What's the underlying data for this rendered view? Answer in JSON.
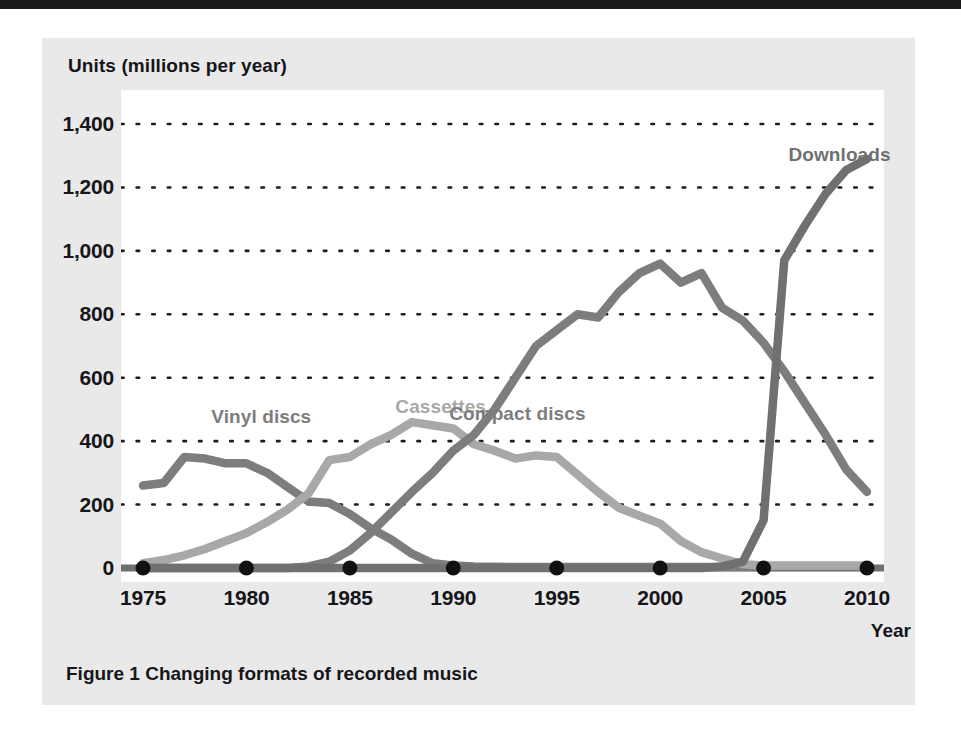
{
  "figure": {
    "caption": "Figure 1  Changing formats of recorded music",
    "panel_color": "#e9e9e9",
    "plot_bg": "#ffffff",
    "top_bar_color": "#1b1b1b"
  },
  "chart_data": {
    "type": "line",
    "title": "Figure 1  Changing formats of recorded music",
    "xlabel": "Year",
    "ylabel": "Units (millions per year)",
    "xlim": [
      1975,
      2010
    ],
    "ylim": [
      0,
      1400
    ],
    "xticks": [
      1975,
      1980,
      1985,
      1990,
      1995,
      2000,
      2005,
      2010
    ],
    "xtick_labels": [
      "1975",
      "1980",
      "1985",
      "1990",
      "1995",
      "2000",
      "2005",
      "2010"
    ],
    "yticks": [
      0,
      200,
      400,
      600,
      800,
      1000,
      1200,
      1400
    ],
    "ytick_labels": [
      "0",
      "200",
      "400",
      "600",
      "800",
      "1,000",
      "1,200",
      "1,400"
    ],
    "grid": "horizontal-dotted",
    "legend_position": "inline-labels",
    "x": [
      1975,
      1976,
      1977,
      1978,
      1979,
      1980,
      1981,
      1982,
      1983,
      1984,
      1985,
      1986,
      1987,
      1988,
      1989,
      1990,
      1991,
      1992,
      1993,
      1994,
      1995,
      1996,
      1997,
      1998,
      1999,
      2000,
      2001,
      2002,
      2003,
      2004,
      2005,
      2006,
      2007,
      2008,
      2009,
      2010
    ],
    "series": [
      {
        "name": "Vinyl discs",
        "color": "#7d7d7d",
        "label_x": 1978.3,
        "label_y": 470,
        "values": [
          260,
          268,
          350,
          345,
          330,
          330,
          300,
          255,
          210,
          205,
          170,
          125,
          90,
          45,
          15,
          8,
          5,
          4,
          3,
          3,
          3,
          3,
          3,
          3,
          3,
          3,
          3,
          3,
          3,
          3,
          3,
          3,
          3,
          3,
          3,
          3
        ]
      },
      {
        "name": "Cassettes",
        "color": "#a8a8a8",
        "label_x": 1987.2,
        "label_y": 500,
        "values": [
          15,
          25,
          40,
          60,
          85,
          110,
          145,
          185,
          235,
          340,
          350,
          390,
          420,
          460,
          450,
          440,
          390,
          370,
          345,
          355,
          350,
          295,
          240,
          190,
          165,
          140,
          85,
          50,
          30,
          12,
          8,
          8,
          8,
          8,
          8,
          8
        ]
      },
      {
        "name": "Compact discs",
        "color": "#7d7d7d",
        "label_x": 1989.8,
        "label_y": 480,
        "values": [
          0,
          0,
          0,
          0,
          0,
          0,
          0,
          0,
          5,
          20,
          55,
          110,
          175,
          240,
          300,
          370,
          420,
          500,
          600,
          700,
          750,
          800,
          790,
          870,
          930,
          960,
          900,
          930,
          820,
          780,
          710,
          620,
          520,
          420,
          310,
          240
        ]
      },
      {
        "name": "Downloads",
        "color": "#707070",
        "label_x": 2006.2,
        "label_y": 1295,
        "values": [
          0,
          0,
          0,
          0,
          0,
          0,
          0,
          0,
          0,
          0,
          0,
          0,
          0,
          0,
          0,
          0,
          0,
          0,
          0,
          0,
          0,
          0,
          0,
          0,
          0,
          0,
          0,
          0,
          5,
          20,
          150,
          970,
          1080,
          1180,
          1255,
          1290
        ]
      }
    ],
    "axis_marker_points": [
      {
        "x": 1975,
        "y": 0
      },
      {
        "x": 1980,
        "y": 0
      },
      {
        "x": 1985,
        "y": 0
      },
      {
        "x": 1990,
        "y": 0
      },
      {
        "x": 1995,
        "y": 0
      },
      {
        "x": 2000,
        "y": 0
      },
      {
        "x": 2005,
        "y": 0
      },
      {
        "x": 2010,
        "y": 0
      }
    ],
    "axis_marker_color": "#111111",
    "baseline_color": "#6f6f6f"
  }
}
